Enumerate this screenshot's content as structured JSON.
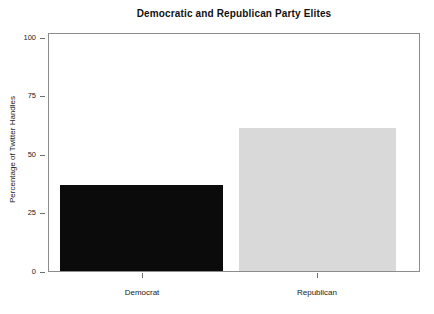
{
  "chart_data": {
    "type": "bar",
    "title": "Democratic and Republican Party Elites",
    "xlabel": "",
    "ylabel": "Percentage of Twitter Handles",
    "categories": [
      "Democrat",
      "Republican"
    ],
    "values": [
      38,
      63
    ],
    "series": [
      {
        "name": "Percentage of Twitter Handles",
        "values": [
          38,
          63
        ]
      }
    ],
    "ylim": [
      0,
      105
    ],
    "yticks": [
      0,
      25,
      50,
      75,
      100
    ],
    "ytick_labels": [
      "0",
      "25",
      "50",
      "75",
      "100"
    ],
    "grid": false,
    "legend": "none",
    "bar_colors": [
      "#0b0b0b",
      "#d9d9d9"
    ],
    "frame_color": "#8c8c8c",
    "background": "#ffffff"
  }
}
